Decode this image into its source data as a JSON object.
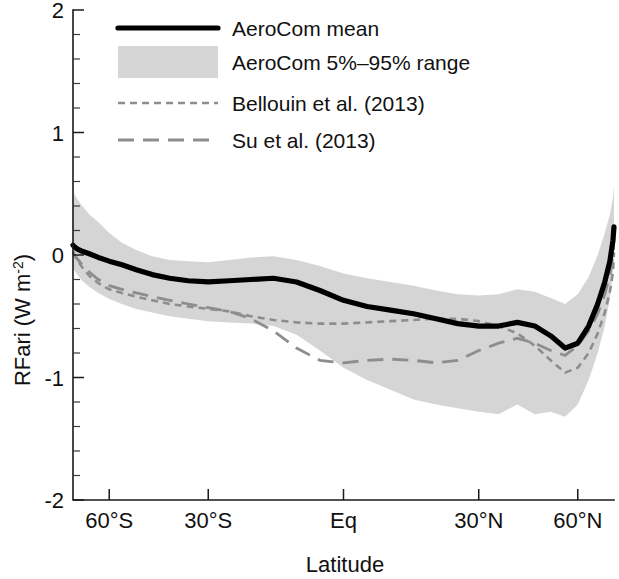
{
  "figure": {
    "background_color": "#ffffff",
    "mean_color": "#000000",
    "band_color": "#d5d5d5",
    "reference_color": "#8d8d8d"
  },
  "axes": {
    "ylabel_main": "RFari (W m",
    "ylabel_exp": "-2",
    "ylabel_close": ")",
    "xlabel": "Latitude",
    "y_ticks": [
      "2",
      "1",
      "0",
      "-1",
      "-2"
    ],
    "y_tick_values": [
      2,
      1,
      0,
      -1,
      -2
    ],
    "y_minor_step": 0.2,
    "x_ticks": [
      "60°S",
      "30°S",
      "Eq",
      "30°N",
      "60°N"
    ],
    "x_tick_values": [
      -60,
      -30,
      0,
      30,
      60
    ],
    "ylim": [
      -2,
      2
    ],
    "xlim": [
      -90,
      90
    ],
    "x_scale": "sine-latitude",
    "grid": false
  },
  "legend": {
    "position": "top-left-inside",
    "items": [
      {
        "label": "AeroCom mean",
        "style": "solid-thick-black"
      },
      {
        "label": "AeroCom 5%–95% range",
        "style": "gray-filled-box"
      },
      {
        "label": "Bellouin et al. (2013)",
        "style": "gray-dotted"
      },
      {
        "label": "Su et al. (2013)",
        "style": "gray-dashed"
      }
    ]
  },
  "chart_data": {
    "type": "line",
    "title": "",
    "xlabel": "Latitude",
    "ylabel": "RFari (W m-2)",
    "xlim": [
      -90,
      90
    ],
    "ylim": [
      -2,
      2
    ],
    "grid": false,
    "legend_position": "upper left",
    "x_tick_labels": [
      "60°S",
      "30°S",
      "Eq",
      "30°N",
      "60°N"
    ],
    "x_tick_values": [
      -60,
      -30,
      0,
      30,
      60
    ],
    "y_tick_values": [
      2,
      1,
      0,
      -1,
      -2
    ],
    "x": [
      -90,
      -85,
      -80,
      -75,
      -70,
      -65,
      -60,
      -55,
      -50,
      -45,
      -40,
      -35,
      -30,
      -25,
      -20,
      -15,
      -10,
      -5,
      0,
      5,
      10,
      15,
      20,
      25,
      30,
      35,
      40,
      45,
      50,
      55,
      60,
      65,
      70,
      75,
      80,
      85,
      90
    ],
    "series": [
      {
        "name": "AeroCom mean",
        "style": "solid",
        "color": "#000000",
        "values": [
          0.08,
          0.07,
          0.05,
          0.03,
          0.01,
          -0.02,
          -0.05,
          -0.08,
          -0.12,
          -0.16,
          -0.19,
          -0.21,
          -0.22,
          -0.21,
          -0.2,
          -0.19,
          -0.22,
          -0.29,
          -0.37,
          -0.42,
          -0.45,
          -0.48,
          -0.52,
          -0.56,
          -0.58,
          -0.58,
          -0.55,
          -0.58,
          -0.66,
          -0.76,
          -0.72,
          -0.58,
          -0.4,
          -0.22,
          -0.05,
          0.12,
          0.23
        ]
      },
      {
        "name": "AeroCom 5%–95% range upper",
        "style": "band-upper",
        "color": "#d5d5d5",
        "values": [
          0.35,
          0.5,
          0.46,
          0.4,
          0.33,
          0.27,
          0.18,
          0.1,
          0.04,
          -0.01,
          -0.04,
          -0.05,
          -0.06,
          -0.04,
          -0.02,
          -0.01,
          -0.04,
          -0.09,
          -0.15,
          -0.19,
          -0.22,
          -0.25,
          -0.29,
          -0.32,
          -0.33,
          -0.32,
          -0.28,
          -0.3,
          -0.35,
          -0.4,
          -0.32,
          -0.18,
          0.0,
          0.18,
          0.33,
          0.47,
          0.57
        ]
      },
      {
        "name": "AeroCom 5%–95% range lower",
        "style": "band-lower",
        "color": "#d5d5d5",
        "values": [
          -0.1,
          -0.12,
          -0.16,
          -0.21,
          -0.26,
          -0.31,
          -0.36,
          -0.4,
          -0.44,
          -0.47,
          -0.5,
          -0.52,
          -0.54,
          -0.55,
          -0.56,
          -0.58,
          -0.65,
          -0.78,
          -0.92,
          -1.02,
          -1.1,
          -1.18,
          -1.22,
          -1.25,
          -1.28,
          -1.3,
          -1.22,
          -1.3,
          -1.28,
          -1.32,
          -1.22,
          -1.02,
          -0.8,
          -0.58,
          -0.36,
          -0.14,
          0.05
        ]
      },
      {
        "name": "Bellouin et al. (2013)",
        "style": "dotted",
        "color": "#8d8d8d",
        "values": [
          0.02,
          0.0,
          -0.04,
          -0.1,
          -0.17,
          -0.23,
          -0.28,
          -0.31,
          -0.34,
          -0.37,
          -0.4,
          -0.42,
          -0.44,
          -0.46,
          -0.5,
          -0.53,
          -0.55,
          -0.56,
          -0.56,
          -0.55,
          -0.54,
          -0.53,
          -0.52,
          -0.52,
          -0.54,
          -0.58,
          -0.64,
          -0.74,
          -0.86,
          -0.96,
          -0.92,
          -0.8,
          -0.64,
          -0.47,
          -0.3,
          -0.14,
          0.02
        ]
      },
      {
        "name": "Su et al. (2013)",
        "style": "dashed",
        "color": "#8d8d8d",
        "values": [
          0.03,
          0.01,
          -0.03,
          -0.08,
          -0.14,
          -0.2,
          -0.25,
          -0.28,
          -0.31,
          -0.34,
          -0.37,
          -0.4,
          -0.43,
          -0.46,
          -0.52,
          -0.62,
          -0.76,
          -0.86,
          -0.88,
          -0.86,
          -0.85,
          -0.86,
          -0.88,
          -0.86,
          -0.78,
          -0.72,
          -0.68,
          -0.72,
          -0.78,
          -0.82,
          -0.74,
          -0.62,
          -0.48,
          -0.32,
          -0.16,
          0.0,
          0.14
        ]
      }
    ]
  }
}
